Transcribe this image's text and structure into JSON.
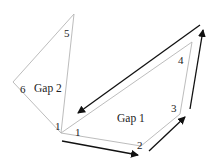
{
  "diagram": {
    "gap1_label": "Gap 1",
    "gap2_label": "Gap 2",
    "vertex_labels": {
      "v1_left": "1",
      "v1_right": "1",
      "v2": "2",
      "v3": "3",
      "v4": "4",
      "v5": "5",
      "v6": "6"
    },
    "colors": {
      "polygon_stroke": "#b4b4b4",
      "arrow": "#111111",
      "background": "#ffffff"
    }
  }
}
